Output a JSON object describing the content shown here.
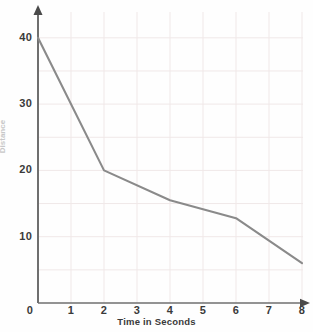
{
  "chart_data": {
    "type": "line",
    "title": "",
    "subtitle": "",
    "xlabel": "Time in Seconds",
    "ylabel": "Distance",
    "x": [
      0,
      2,
      4,
      6,
      8
    ],
    "values": [
      40,
      20,
      15.5,
      12.8,
      6
    ],
    "series": [
      {
        "name": "distance",
        "x": [
          0,
          2,
          4,
          6,
          8
        ],
        "values": [
          40,
          20,
          15.5,
          12.8,
          6
        ]
      }
    ],
    "xlim": [
      0,
      8.4
    ],
    "ylim": [
      0,
      42
    ],
    "xticks": [
      0,
      1,
      2,
      3,
      4,
      5,
      6,
      7,
      8
    ],
    "xtick_labels": [
      "0",
      "1",
      "2",
      "3",
      "4",
      "5",
      "6",
      "7",
      "8"
    ],
    "yticks": [
      10,
      20,
      30,
      40
    ],
    "ytick_labels": [
      "10",
      "20",
      "30",
      "40"
    ],
    "grid": true,
    "grid_step_x": 1,
    "grid_step_y": 5,
    "legend": false,
    "legend_position": "none",
    "line_color": "#8a8a8a",
    "grid_color": "#f0e8e8",
    "axis_color": "#6f6f6f",
    "background_color": "#fefefe",
    "text_color": "#3a3a3a"
  },
  "axes": {
    "x_title": "Time in Seconds",
    "y_title": "Distance"
  },
  "ticks": {
    "x": [
      "0",
      "1",
      "2",
      "3",
      "4",
      "5",
      "6",
      "7",
      "8"
    ],
    "y": [
      "40",
      "30",
      "20",
      "10"
    ]
  }
}
